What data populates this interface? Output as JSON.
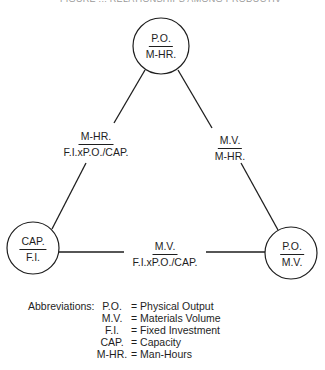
{
  "header": {
    "cut_off_text": "FIGURE ... RELATIONSHIPS AMONG PRODUCTIVITY RATIOS"
  },
  "diagram": {
    "nodes": [
      {
        "id": "top",
        "numerator": "P.O.",
        "denominator": "M-HR.",
        "cx": 161,
        "cy": 46,
        "r": 28
      },
      {
        "id": "left",
        "numerator": "CAP.",
        "denominator": "F.I.",
        "cx": 33,
        "cy": 248,
        "r": 26
      },
      {
        "id": "right",
        "numerator": "P.O.",
        "denominator": "M.V.",
        "cx": 291,
        "cy": 253,
        "r": 26
      }
    ],
    "edges": [
      {
        "id": "top-left",
        "from": "top",
        "to": "left",
        "numerator": "M-HR.",
        "denominator": "F.I.xP.O./CAP."
      },
      {
        "id": "top-right",
        "from": "top",
        "to": "right",
        "numerator": "M.V.",
        "denominator": "M-HR."
      },
      {
        "id": "left-right",
        "from": "left",
        "to": "right",
        "numerator": "M.V.",
        "denominator": "F.I.xP.O./CAP."
      }
    ],
    "line_color": "#1e1e1e"
  },
  "abbreviations": {
    "title": "Abbreviations:",
    "items": [
      {
        "key": "P.O.",
        "value": "= Physical Output"
      },
      {
        "key": "M.V.",
        "value": "= Materials Volume"
      },
      {
        "key": "F.I.",
        "value": "= Fixed Investment"
      },
      {
        "key": "CAP.",
        "value": "= Capacity"
      },
      {
        "key": "M-HR.",
        "value": "= Man-Hours"
      }
    ]
  }
}
